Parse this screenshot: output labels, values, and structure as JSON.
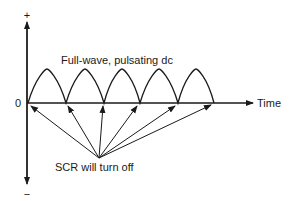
{
  "labels": {
    "y_plus": "+",
    "y_minus": "−",
    "origin": "0",
    "x_axis": "Time",
    "waveform": "Full-wave, pulsating dc",
    "annotation": "SCR will turn off"
  },
  "colors": {
    "stroke": "#1a1a1a",
    "background": "#ffffff"
  },
  "waveform": {
    "type": "full-wave rectified sine",
    "hump_count": 5,
    "zero_crossings_px": [
      28,
      66,
      104,
      140,
      178,
      214
    ]
  }
}
